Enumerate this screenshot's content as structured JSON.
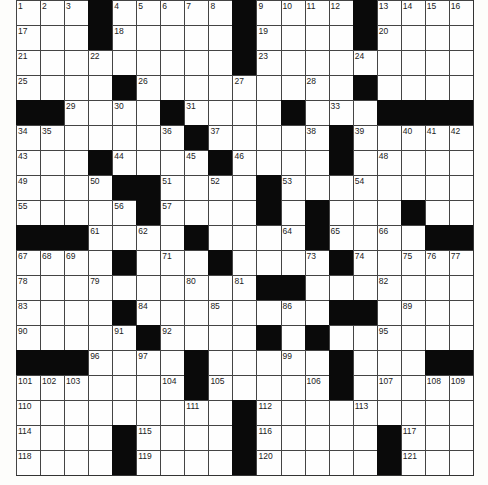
{
  "puzzle": {
    "rows": 19,
    "cols": 19,
    "colors": {
      "black": "#0a0a0a",
      "white": "#fefefe",
      "line": "#444444"
    },
    "grid": [
      "...#.....#....#....",
      "...#.....#....#....",
      ".........#.........",
      "....#.........#....",
      "##....#....#...####",
      ".......#.....#.....",
      "...#....#....#.....",
      "....##....#........",
      ".....#....#.#...#..",
      "###....#....#....##",
      "....#...#....#.....",
      "..........##.......",
      "....#........##....",
      ".....#....#.#......",
      "###....#.....#...##",
      ".......#.....#.....",
      ".........#.........",
      "....#....#.....#...",
      "....#....#.....#..."
    ],
    "numbers": [
      {
        "r": 0,
        "c": 0,
        "n": "1"
      },
      {
        "r": 0,
        "c": 1,
        "n": "2"
      },
      {
        "r": 0,
        "c": 2,
        "n": "3"
      },
      {
        "r": 0,
        "c": 4,
        "n": "4"
      },
      {
        "r": 0,
        "c": 5,
        "n": "5"
      },
      {
        "r": 0,
        "c": 6,
        "n": "6"
      },
      {
        "r": 0,
        "c": 7,
        "n": "7"
      },
      {
        "r": 0,
        "c": 8,
        "n": "8"
      },
      {
        "r": 0,
        "c": 10,
        "n": "9"
      },
      {
        "r": 0,
        "c": 11,
        "n": "10"
      },
      {
        "r": 0,
        "c": 12,
        "n": "11"
      },
      {
        "r": 0,
        "c": 13,
        "n": "12"
      },
      {
        "r": 0,
        "c": 15,
        "n": "13"
      },
      {
        "r": 0,
        "c": 16,
        "n": "14"
      },
      {
        "r": 0,
        "c": 17,
        "n": "15"
      },
      {
        "r": 0,
        "c": 18,
        "n": "16"
      },
      {
        "r": 1,
        "c": 0,
        "n": "17"
      },
      {
        "r": 1,
        "c": 4,
        "n": "18"
      },
      {
        "r": 1,
        "c": 10,
        "n": "19"
      },
      {
        "r": 1,
        "c": 15,
        "n": "20"
      },
      {
        "r": 2,
        "c": 0,
        "n": "21"
      },
      {
        "r": 2,
        "c": 3,
        "n": "22"
      },
      {
        "r": 2,
        "c": 10,
        "n": "23"
      },
      {
        "r": 2,
        "c": 14,
        "n": "24"
      },
      {
        "r": 3,
        "c": 0,
        "n": "25"
      },
      {
        "r": 3,
        "c": 5,
        "n": "26"
      },
      {
        "r": 3,
        "c": 9,
        "n": "27"
      },
      {
        "r": 3,
        "c": 12,
        "n": "28"
      },
      {
        "r": 4,
        "c": 2,
        "n": "29"
      },
      {
        "r": 4,
        "c": 4,
        "n": "30"
      },
      {
        "r": 4,
        "c": 7,
        "n": "31"
      },
      {
        "r": 4,
        "c": 11,
        "n": "32"
      },
      {
        "r": 4,
        "c": 13,
        "n": "33"
      },
      {
        "r": 5,
        "c": 0,
        "n": "34"
      },
      {
        "r": 5,
        "c": 1,
        "n": "35"
      },
      {
        "r": 5,
        "c": 6,
        "n": "36"
      },
      {
        "r": 5,
        "c": 8,
        "n": "37"
      },
      {
        "r": 5,
        "c": 12,
        "n": "38"
      },
      {
        "r": 5,
        "c": 14,
        "n": "39"
      },
      {
        "r": 5,
        "c": 16,
        "n": "40"
      },
      {
        "r": 5,
        "c": 17,
        "n": "41"
      },
      {
        "r": 5,
        "c": 18,
        "n": "42"
      },
      {
        "r": 6,
        "c": 0,
        "n": "43"
      },
      {
        "r": 6,
        "c": 4,
        "n": "44"
      },
      {
        "r": 6,
        "c": 7,
        "n": "45"
      },
      {
        "r": 6,
        "c": 9,
        "n": "46"
      },
      {
        "r": 6,
        "c": 13,
        "n": "47"
      },
      {
        "r": 6,
        "c": 15,
        "n": "48"
      },
      {
        "r": 7,
        "c": 0,
        "n": "49"
      },
      {
        "r": 7,
        "c": 3,
        "n": "50"
      },
      {
        "r": 7,
        "c": 6,
        "n": "51"
      },
      {
        "r": 7,
        "c": 8,
        "n": "52"
      },
      {
        "r": 7,
        "c": 11,
        "n": "53"
      },
      {
        "r": 7,
        "c": 14,
        "n": "54"
      },
      {
        "r": 8,
        "c": 0,
        "n": "55"
      },
      {
        "r": 8,
        "c": 4,
        "n": "56"
      },
      {
        "r": 8,
        "c": 6,
        "n": "57"
      },
      {
        "r": 8,
        "c": 10,
        "n": "58"
      },
      {
        "r": 8,
        "c": 12,
        "n": "59"
      },
      {
        "r": 8,
        "c": 16,
        "n": "60"
      },
      {
        "r": 9,
        "c": 3,
        "n": "61"
      },
      {
        "r": 9,
        "c": 5,
        "n": "62"
      },
      {
        "r": 9,
        "c": 7,
        "n": "63"
      },
      {
        "r": 9,
        "c": 11,
        "n": "64"
      },
      {
        "r": 9,
        "c": 13,
        "n": "65"
      },
      {
        "r": 9,
        "c": 15,
        "n": "66"
      },
      {
        "r": 10,
        "c": 0,
        "n": "67"
      },
      {
        "r": 10,
        "c": 1,
        "n": "68"
      },
      {
        "r": 10,
        "c": 2,
        "n": "69"
      },
      {
        "r": 10,
        "c": 4,
        "n": "70"
      },
      {
        "r": 10,
        "c": 6,
        "n": "71"
      },
      {
        "r": 10,
        "c": 8,
        "n": "72"
      },
      {
        "r": 10,
        "c": 12,
        "n": "73"
      },
      {
        "r": 10,
        "c": 14,
        "n": "74"
      },
      {
        "r": 10,
        "c": 16,
        "n": "75"
      },
      {
        "r": 10,
        "c": 17,
        "n": "76"
      },
      {
        "r": 10,
        "c": 18,
        "n": "77"
      },
      {
        "r": 11,
        "c": 0,
        "n": "78"
      },
      {
        "r": 11,
        "c": 3,
        "n": "79"
      },
      {
        "r": 11,
        "c": 7,
        "n": "80"
      },
      {
        "r": 11,
        "c": 9,
        "n": "81"
      },
      {
        "r": 11,
        "c": 15,
        "n": "82"
      },
      {
        "r": 12,
        "c": 0,
        "n": "83"
      },
      {
        "r": 12,
        "c": 5,
        "n": "84"
      },
      {
        "r": 12,
        "c": 8,
        "n": "85"
      },
      {
        "r": 12,
        "c": 11,
        "n": "86"
      },
      {
        "r": 12,
        "c": 13,
        "n": "87"
      },
      {
        "r": 12,
        "c": 14,
        "n": "88"
      },
      {
        "r": 12,
        "c": 16,
        "n": "89"
      },
      {
        "r": 13,
        "c": 0,
        "n": "90"
      },
      {
        "r": 13,
        "c": 4,
        "n": "91"
      },
      {
        "r": 13,
        "c": 6,
        "n": "92"
      },
      {
        "r": 13,
        "c": 10,
        "n": "93"
      },
      {
        "r": 13,
        "c": 12,
        "n": "94"
      },
      {
        "r": 13,
        "c": 15,
        "n": "95"
      },
      {
        "r": 14,
        "c": 3,
        "n": "96"
      },
      {
        "r": 14,
        "c": 5,
        "n": "97"
      },
      {
        "r": 14,
        "c": 7,
        "n": "98"
      },
      {
        "r": 14,
        "c": 11,
        "n": "99"
      },
      {
        "r": 14,
        "c": 13,
        "n": "100"
      },
      {
        "r": 15,
        "c": 0,
        "n": "101"
      },
      {
        "r": 15,
        "c": 1,
        "n": "102"
      },
      {
        "r": 15,
        "c": 2,
        "n": "103"
      },
      {
        "r": 15,
        "c": 6,
        "n": "104"
      },
      {
        "r": 15,
        "c": 8,
        "n": "105"
      },
      {
        "r": 15,
        "c": 12,
        "n": "106"
      },
      {
        "r": 15,
        "c": 15,
        "n": "107"
      },
      {
        "r": 15,
        "c": 17,
        "n": "108"
      },
      {
        "r": 15,
        "c": 18,
        "n": "109"
      },
      {
        "r": 16,
        "c": 0,
        "n": "110"
      },
      {
        "r": 16,
        "c": 7,
        "n": "111"
      },
      {
        "r": 16,
        "c": 10,
        "n": "112"
      },
      {
        "r": 16,
        "c": 14,
        "n": "113"
      },
      {
        "r": 17,
        "c": 0,
        "n": "114"
      },
      {
        "r": 17,
        "c": 5,
        "n": "115"
      },
      {
        "r": 17,
        "c": 10,
        "n": "116"
      },
      {
        "r": 17,
        "c": 16,
        "n": "117"
      },
      {
        "r": 18,
        "c": 0,
        "n": "118"
      },
      {
        "r": 18,
        "c": 5,
        "n": "119"
      },
      {
        "r": 18,
        "c": 10,
        "n": "120"
      },
      {
        "r": 18,
        "c": 16,
        "n": "121"
      }
    ]
  }
}
